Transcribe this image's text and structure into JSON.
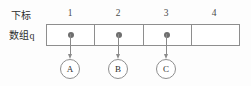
{
  "diagram": {
    "row_labels": {
      "index_label": "下标",
      "array_label": "数组q"
    },
    "indices": [
      "1",
      "2",
      "3",
      "4"
    ],
    "cells": [
      {
        "index": "1",
        "has_pointer": true,
        "target": "A"
      },
      {
        "index": "2",
        "has_pointer": true,
        "target": "B"
      },
      {
        "index": "3",
        "has_pointer": true,
        "target": "C"
      },
      {
        "index": "4",
        "has_pointer": false,
        "target": ""
      }
    ],
    "nodes": [
      {
        "label": "A"
      },
      {
        "label": "B"
      },
      {
        "label": "C"
      }
    ],
    "colors": {
      "background": "#fdfdfd",
      "border": "#8e8e8e",
      "dot": "#6e6e6e",
      "arrow": "#8a8a8a",
      "text": "#2e2e2e"
    }
  }
}
